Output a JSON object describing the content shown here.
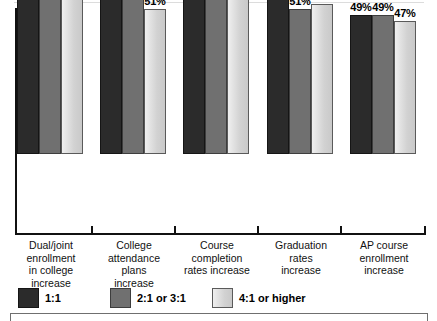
{
  "chart_data": {
    "type": "bar",
    "title": "",
    "xlabel": "",
    "ylabel": "",
    "ylim": [
      0,
      80
    ],
    "grid": false,
    "legend_position": "bottom",
    "categories": [
      "Dual/joint enrollment in college increase",
      "College attendance plans increase",
      "Course completion rates increase",
      "Graduation rates increase",
      "AP course enrollment increase"
    ],
    "series": [
      {
        "name": "1:1",
        "color": "#2b2b2b",
        "values": [
          71,
          66,
          64,
          57,
          49
        ]
      },
      {
        "name": "2:1 or 3:1",
        "color": "#707070",
        "values": [
          66,
          57,
          58,
          51,
          49
        ]
      },
      {
        "name": "4:1 or higher",
        "color": "#d2d2d2",
        "values": [
          59,
          51,
          56,
          53,
          47
        ]
      }
    ],
    "value_suffix": "%"
  },
  "groups": [
    {
      "label_lines": [
        "Dual/joint",
        "enrollment",
        "in college",
        "increase"
      ],
      "bars": [
        {
          "series": "1:1",
          "value": 71,
          "label": "71%"
        },
        {
          "series": "2:1 or 3:1",
          "value": 66,
          "label": "66%"
        },
        {
          "series": "4:1 or higher",
          "value": 59,
          "label": "59%"
        }
      ]
    },
    {
      "label_lines": [
        "College",
        "attendance",
        "plans",
        "increase"
      ],
      "bars": [
        {
          "series": "1:1",
          "value": 66,
          "label": "66%"
        },
        {
          "series": "2:1 or 3:1",
          "value": 57,
          "label": "57%"
        },
        {
          "series": "4:1 or higher",
          "value": 51,
          "label": "51%"
        }
      ]
    },
    {
      "label_lines": [
        "Course",
        "completion",
        "rates increase"
      ],
      "bars": [
        {
          "series": "1:1",
          "value": 64,
          "label": "64%"
        },
        {
          "series": "2:1 or 3:1",
          "value": 58,
          "label": "58%"
        },
        {
          "series": "4:1 or higher",
          "value": 56,
          "label": "56%"
        }
      ]
    },
    {
      "label_lines": [
        "Graduation",
        "rates",
        "increase"
      ],
      "bars": [
        {
          "series": "1:1",
          "value": 57,
          "label": "57%"
        },
        {
          "series": "2:1 or 3:1",
          "value": 51,
          "label": "51%"
        },
        {
          "series": "4:1 or higher",
          "value": 53,
          "label": "53%"
        }
      ]
    },
    {
      "label_lines": [
        "AP course",
        "enrollment",
        "increase"
      ],
      "bars": [
        {
          "series": "1:1",
          "value": 49,
          "label": "49%"
        },
        {
          "series": "2:1 or 3:1",
          "value": 49,
          "label": "49%"
        },
        {
          "series": "4:1 or higher",
          "value": 47,
          "label": "47%"
        }
      ]
    }
  ],
  "legend": {
    "items": [
      {
        "label": "1:1",
        "color": "#2b2b2b"
      },
      {
        "label": "2:1 or 3:1",
        "color": "#707070"
      },
      {
        "label": "4:1 or higher",
        "color": "#d2d2d2"
      }
    ]
  }
}
